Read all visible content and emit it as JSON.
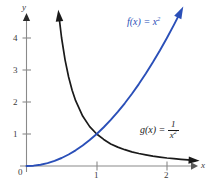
{
  "chart_data": {
    "type": "line",
    "title": "",
    "xlabel": "x",
    "ylabel": "y",
    "xlim": [
      -0.1,
      2.45
    ],
    "ylim": [
      -0.15,
      4.9
    ],
    "grid": false,
    "legend": "inline-annotations",
    "x_ticks": [
      "1",
      "2"
    ],
    "x_tick_values": [
      1,
      2
    ],
    "y_ticks": [
      "1",
      "2",
      "3",
      "4"
    ],
    "y_tick_values": [
      1,
      2,
      3,
      4
    ],
    "origin_label": "0",
    "series": [
      {
        "name": "f(x) = x^2",
        "color": "#2a4fb8",
        "arrow": "end",
        "x": [
          0,
          0.1,
          0.2,
          0.3,
          0.4,
          0.5,
          0.6,
          0.7,
          0.8,
          0.9,
          1.0,
          1.1,
          1.2,
          1.3,
          1.4,
          1.5,
          1.6,
          1.7,
          1.8,
          1.9,
          2.0,
          2.1,
          2.2
        ],
        "values": [
          0,
          0.01,
          0.04,
          0.09,
          0.16,
          0.25,
          0.36,
          0.49,
          0.64,
          0.81,
          1.0,
          1.21,
          1.44,
          1.69,
          1.96,
          2.25,
          2.56,
          2.89,
          3.24,
          3.61,
          4.0,
          4.41,
          4.84
        ]
      },
      {
        "name": "g(x) = 1/x^2",
        "color": "#1a1a1a",
        "arrow": "both",
        "x": [
          0.46,
          0.5,
          0.55,
          0.6,
          0.65,
          0.7,
          0.8,
          0.9,
          1.0,
          1.1,
          1.2,
          1.3,
          1.4,
          1.5,
          1.6,
          1.7,
          1.8,
          1.9,
          2.0,
          2.1,
          2.2,
          2.3,
          2.4
        ],
        "values": [
          4.73,
          4.0,
          3.31,
          2.78,
          2.37,
          2.04,
          1.56,
          1.23,
          1.0,
          0.83,
          0.69,
          0.59,
          0.51,
          0.44,
          0.39,
          0.35,
          0.31,
          0.28,
          0.25,
          0.23,
          0.21,
          0.19,
          0.17
        ]
      }
    ],
    "annotations": [
      {
        "name": "f-label",
        "text_head": "f",
        "text_args": "(x) = ",
        "text_var": "x",
        "text_exp": "2",
        "color": "#2a4fb8"
      },
      {
        "name": "g-label",
        "text_head": "g",
        "text_args": "(x) = ",
        "numerator": "1",
        "den_var": "x",
        "den_exp": "2",
        "color": "#1a1a1a"
      }
    ]
  },
  "axes": {
    "x_axis_name": "x",
    "y_axis_name": "y",
    "axis_color": "#8a8a8a",
    "origin": "0",
    "x_tick_1": "1",
    "x_tick_2": "2",
    "y_tick_1": "1",
    "y_tick_2": "2",
    "y_tick_3": "3",
    "y_tick_4": "4"
  },
  "labels": {
    "f_fn": "f",
    "f_arg": "(x) = ",
    "f_base": "x",
    "f_exp": "2",
    "g_fn": "g",
    "g_arg": "(x) = ",
    "g_num": "1",
    "g_den_base": "x",
    "g_den_exp": "2"
  }
}
